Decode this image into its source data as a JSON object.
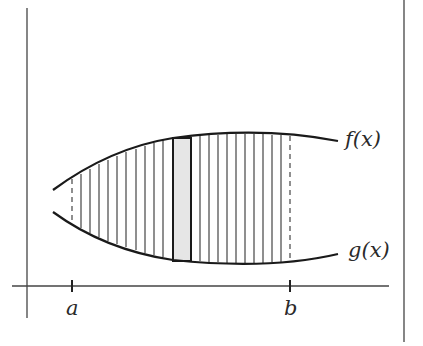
{
  "diagram": {
    "curves": [
      {
        "name": "f(x)",
        "label": "f(x)",
        "role": "upper"
      },
      {
        "name": "g(x)",
        "label": "g(x)",
        "role": "lower"
      }
    ],
    "axis_labels": {
      "a": "a",
      "b": "b"
    },
    "bounds": {
      "left": "a",
      "right": "b",
      "style": "dashed"
    },
    "representative_strip": {
      "fill": "#e6e6e6",
      "description": "shaded rectangle between g(x) and f(x)"
    },
    "hatching": {
      "type": "vertical lines",
      "count_left": 11,
      "count_right": 10
    },
    "colors": {
      "ink": "#2a2a2a",
      "strip_fill": "#e6e6e6",
      "background": "#ffffff"
    }
  }
}
